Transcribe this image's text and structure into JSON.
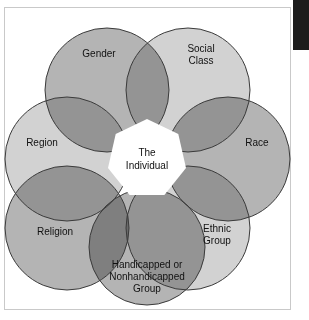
{
  "figure": {
    "kind": "venn-diagram",
    "background_color": "#ffffff",
    "frame_border_color": "#c9c9c9",
    "corner_mark_color": "#1c1c1c",
    "stroke_color": "#3a3a3a",
    "center": {
      "label_line_1": "The",
      "label_line_2": "Individual",
      "fill": "#ffffff"
    },
    "circles": [
      {
        "id": "gender",
        "label_lines": [
          "Gender"
        ],
        "fill": "#b4b4b4",
        "cx": 103,
        "cy": 83,
        "r": 62,
        "label_x": 95,
        "label_y": 47
      },
      {
        "id": "social-class",
        "label_lines": [
          "Social",
          "Class"
        ],
        "fill": "#d2d2d2",
        "cx": 184,
        "cy": 83,
        "r": 62,
        "label_x": 197,
        "label_y": 42
      },
      {
        "id": "race",
        "label_lines": [
          "Race"
        ],
        "fill": "#b4b4b4",
        "cx": 224,
        "cy": 152,
        "r": 62,
        "label_x": 253,
        "label_y": 136
      },
      {
        "id": "ethnic-group",
        "label_lines": [
          "Ethnic",
          "Group"
        ],
        "fill": "#d2d2d2",
        "cx": 184,
        "cy": 221,
        "r": 62,
        "label_x": 213,
        "label_y": 222
      },
      {
        "id": "handicapped-group",
        "label_lines": [
          "Handicapped or",
          "Nonhandicapped",
          "Group"
        ],
        "fill": "#b4b4b4",
        "cx": 143,
        "cy": 240,
        "r": 58,
        "label_x": 143,
        "label_y": 258
      },
      {
        "id": "religion",
        "label_lines": [
          "Religion"
        ],
        "fill": "#b4b4b4",
        "cx": 63,
        "cy": 221,
        "r": 62,
        "label_x": 51,
        "label_y": 225
      },
      {
        "id": "region",
        "label_lines": [
          "Region"
        ],
        "fill": "#d2d2d2",
        "cx": 63,
        "cy": 152,
        "r": 62,
        "label_x": 38,
        "label_y": 136
      }
    ]
  },
  "chart_data": {
    "type": "venn",
    "title": "",
    "center_label": "The Individual",
    "categories": [
      "Gender",
      "Social Class",
      "Race",
      "Ethnic Group",
      "Handicapped or Nonhandicapped Group",
      "Religion",
      "Region"
    ],
    "legend": "none",
    "grid": false
  }
}
